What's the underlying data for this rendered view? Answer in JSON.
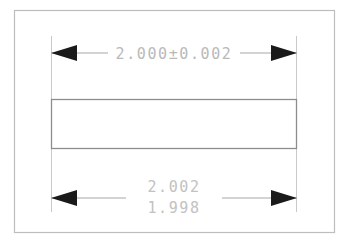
{
  "drawing": {
    "title": "Dimension tolerance comparison",
    "background_color": "#ffffff",
    "frame": {
      "name": "drawing-border",
      "color": "#bdbdbd",
      "x": 14,
      "y": 10,
      "width": 321,
      "height": 223
    },
    "part": {
      "name": "rectangular-part-outline",
      "color": "#8d8d8d",
      "x": 51,
      "y": 99,
      "width": 246,
      "height": 50
    },
    "line_color": "#c4c4c4",
    "arrow_color": "#1a1a1a",
    "text_color": "#b9b9b9",
    "extension_lines": [
      {
        "name": "extension-line-left",
        "x": 51,
        "y1": 36,
        "y2": 212
      },
      {
        "name": "extension-line-right",
        "x": 297,
        "y1": 36,
        "y2": 212
      }
    ],
    "dimensions": [
      {
        "id": "top-dimension",
        "type": "plus-minus-tolerance",
        "label": "2.000±0.002",
        "nominal": "2.000",
        "tolerance": "±0.002",
        "upper_limit": "2.002",
        "lower_limit": "1.998",
        "line_y": 53,
        "x_start": 51,
        "x_end": 297,
        "text_x": 174,
        "text_y": 53,
        "arrow_direction": "outward"
      },
      {
        "id": "bottom-dimension",
        "type": "limit-dimension",
        "label_upper": "2.002",
        "label_lower": "1.998",
        "line_y": 198,
        "x_start": 51,
        "x_end": 297,
        "text_x": 174,
        "text_upper_y": 187,
        "text_lower_y": 207,
        "arrow_direction": "outward"
      }
    ]
  }
}
